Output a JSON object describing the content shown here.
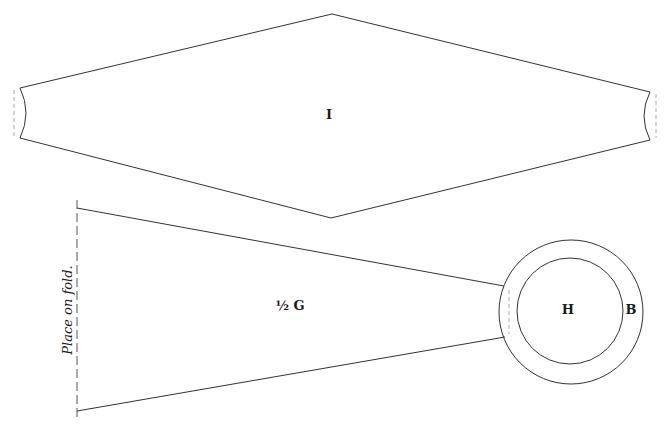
{
  "pieces": {
    "I": {
      "label": "I"
    },
    "G": {
      "label": "½ G",
      "fold_note": "Place on fold."
    },
    "H": {
      "label": "H"
    },
    "B": {
      "label": "B"
    }
  },
  "colors": {
    "line": "#333333",
    "dashed": "#aaaaaa",
    "background": "#ffffff"
  }
}
